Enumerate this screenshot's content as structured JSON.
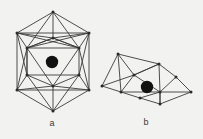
{
  "figure": {
    "caption_a": "a",
    "caption_b": "b",
    "background_color": "#f2f2f0",
    "edge_color": "#3a3a3a",
    "vertex_color": "#2b2b2b",
    "center_atom_color": "#111111",
    "panels": [
      {
        "id": "a",
        "label": "a",
        "label_x": 52,
        "label_y": 124,
        "shape_name": "icosahedron",
        "center_atom": {
          "cx": 52,
          "cy": 62,
          "r": 6.2
        },
        "vertices": [
          {
            "name": "top-apex",
            "x": 53,
            "y": 12
          },
          {
            "name": "upper-left",
            "x": 17,
            "y": 33
          },
          {
            "name": "upper-right",
            "x": 89,
            "y": 33
          },
          {
            "name": "upper-mid-left",
            "x": 27,
            "y": 48
          },
          {
            "name": "upper-mid-right",
            "x": 79,
            "y": 48
          },
          {
            "name": "mid-left",
            "x": 17,
            "y": 90
          },
          {
            "name": "mid-right",
            "x": 89,
            "y": 90
          },
          {
            "name": "lower-mid-left",
            "x": 27,
            "y": 75
          },
          {
            "name": "lower-mid-right",
            "x": 79,
            "y": 75
          },
          {
            "name": "inner-upper",
            "x": 53,
            "y": 38
          },
          {
            "name": "inner-lower",
            "x": 53,
            "y": 86
          },
          {
            "name": "bottom-apex",
            "x": 53,
            "y": 111
          }
        ],
        "edges": [
          [
            0,
            1
          ],
          [
            0,
            2
          ],
          [
            0,
            3
          ],
          [
            0,
            4
          ],
          [
            0,
            9
          ],
          [
            1,
            2
          ],
          [
            1,
            3
          ],
          [
            1,
            5
          ],
          [
            1,
            7
          ],
          [
            1,
            9
          ],
          [
            2,
            4
          ],
          [
            2,
            6
          ],
          [
            2,
            8
          ],
          [
            2,
            9
          ],
          [
            3,
            4
          ],
          [
            3,
            7
          ],
          [
            3,
            9
          ],
          [
            3,
            10
          ],
          [
            3,
            5
          ],
          [
            4,
            8
          ],
          [
            4,
            9
          ],
          [
            4,
            10
          ],
          [
            4,
            6
          ],
          [
            5,
            6
          ],
          [
            5,
            7
          ],
          [
            5,
            10
          ],
          [
            5,
            11
          ],
          [
            6,
            8
          ],
          [
            6,
            10
          ],
          [
            6,
            11
          ],
          [
            7,
            8
          ],
          [
            7,
            10
          ],
          [
            7,
            11
          ],
          [
            7,
            3
          ],
          [
            8,
            10
          ],
          [
            8,
            11
          ],
          [
            9,
            3
          ],
          [
            9,
            4
          ],
          [
            10,
            11
          ],
          [
            1,
            4
          ],
          [
            2,
            3
          ]
        ]
      },
      {
        "id": "b",
        "label": "b",
        "label_x": 146,
        "label_y": 123,
        "shape_name": "distorted-polyhedron",
        "center_atom": {
          "cx": 147,
          "cy": 87,
          "r": 6.2
        },
        "vertices": [
          {
            "name": "left-apex",
            "x": 118,
            "y": 54
          },
          {
            "name": "far-left",
            "x": 102,
            "y": 86
          },
          {
            "name": "left-lower",
            "x": 121,
            "y": 92
          },
          {
            "name": "left-inner",
            "x": 134,
            "y": 75
          },
          {
            "name": "mid-upper",
            "x": 159,
            "y": 64
          },
          {
            "name": "mid-lower-inner",
            "x": 160,
            "y": 92
          },
          {
            "name": "right-upper",
            "x": 176,
            "y": 77
          },
          {
            "name": "right-apex",
            "x": 191,
            "y": 92
          },
          {
            "name": "bottom-mid",
            "x": 160,
            "y": 104
          },
          {
            "name": "bottom-left",
            "x": 140,
            "y": 98
          }
        ],
        "edges": [
          [
            0,
            1
          ],
          [
            0,
            2
          ],
          [
            0,
            3
          ],
          [
            0,
            4
          ],
          [
            1,
            2
          ],
          [
            1,
            3
          ],
          [
            2,
            3
          ],
          [
            2,
            9
          ],
          [
            3,
            4
          ],
          [
            3,
            5
          ],
          [
            4,
            5
          ],
          [
            4,
            6
          ],
          [
            5,
            6
          ],
          [
            5,
            7
          ],
          [
            5,
            8
          ],
          [
            6,
            7
          ],
          [
            7,
            8
          ],
          [
            8,
            5
          ],
          [
            8,
            9
          ],
          [
            9,
            5
          ],
          [
            2,
            5
          ],
          [
            4,
            3
          ]
        ]
      }
    ]
  }
}
